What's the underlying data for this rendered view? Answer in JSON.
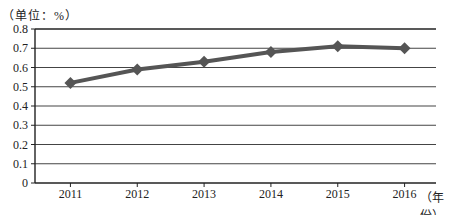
{
  "chart_data": {
    "type": "line",
    "title": "",
    "ylabel": "（单位：%）",
    "xlabel": "（年份）",
    "categories": [
      "2011",
      "2012",
      "2013",
      "2014",
      "2015",
      "2016"
    ],
    "series": [
      {
        "name": "",
        "values": [
          0.52,
          0.59,
          0.63,
          0.68,
          0.71,
          0.7
        ],
        "marker": "diamond",
        "color": "#555555"
      }
    ],
    "yticks": [
      "0",
      "0.1",
      "0.2",
      "0.3",
      "0.4",
      "0.5",
      "0.6",
      "0.7",
      "0.8"
    ],
    "ylim": [
      0,
      0.8
    ],
    "grid": true,
    "legend": null
  },
  "labels": {
    "unit": "（单位：%）",
    "x_unit": "（年份）"
  }
}
